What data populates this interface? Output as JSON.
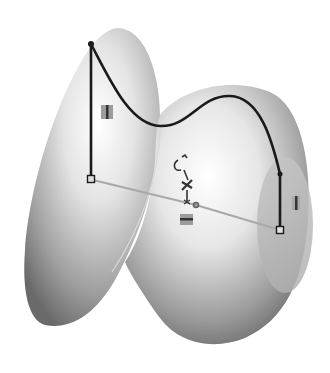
{
  "figure": {
    "background": "#ffffff",
    "surface_color_light": "#f2f2f2",
    "surface_color_dark": "#6e6e6e",
    "curve_color": "#1a1a1a",
    "connector_color": "#a8a8a8"
  },
  "icons": {
    "left_profile_marker": "vertical-bar-marker-icon",
    "right_profile_marker": "vertical-bar-marker-icon",
    "center_marker": "horizontal-bar-marker-icon",
    "triad": "coordinate-triad-icon"
  }
}
